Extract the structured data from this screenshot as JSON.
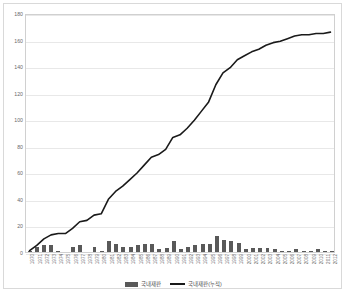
{
  "chart_data": {
    "type": "bar",
    "title": "",
    "xlabel": "",
    "ylabel": "",
    "ylim": [
      0,
      180
    ],
    "ytick_step": 20,
    "yticks": [
      "0",
      "20",
      "40",
      "60",
      "80",
      "100",
      "120",
      "140",
      "160",
      "180"
    ],
    "grid": true,
    "legend_position": "bottom",
    "colors": {
      "bar": "#595959",
      "line": "#1a1a1a",
      "gridline": "#e8e8e8",
      "border": "#d0d0d0",
      "frame": "#d9d9d9",
      "tick_text": "#6a6a6a"
    },
    "categories": [
      "1970",
      "1971",
      "1972",
      "1973",
      "1974",
      "1975",
      "1976",
      "1977",
      "1978",
      "1979",
      "1980",
      "1981",
      "1982",
      "1983",
      "1984",
      "1985",
      "1986",
      "1987",
      "1988",
      "1989",
      "1990",
      "1991",
      "1992",
      "1993",
      "1994",
      "1995",
      "1996",
      "1997",
      "1998",
      "1999",
      "2000",
      "2001",
      "2002",
      "2003",
      "2004",
      "2005",
      "2006",
      "2007",
      "2008",
      "2009",
      "2010",
      "2011",
      "2012"
    ],
    "series": [
      {
        "name": "국내재판",
        "type": "bar",
        "values": [
          1,
          4,
          5,
          5,
          1,
          0,
          4,
          5,
          0,
          4,
          1,
          8,
          6,
          4,
          4,
          5,
          6,
          6,
          2,
          3,
          8,
          2,
          4,
          5,
          6,
          6,
          12,
          9,
          8,
          7,
          2,
          3,
          3,
          3,
          2,
          1,
          1,
          2,
          1,
          1,
          2,
          1,
          1
        ]
      },
      {
        "name": "국내재판(누적)",
        "type": "line",
        "values": [
          1,
          5,
          10,
          13,
          14,
          14,
          18,
          23,
          24,
          28,
          29,
          40,
          46,
          50,
          55,
          60,
          66,
          72,
          74,
          78,
          87,
          89,
          94,
          100,
          107,
          114,
          127,
          136,
          140,
          146,
          149,
          152,
          154,
          157,
          159,
          160,
          162,
          164,
          165,
          165,
          166,
          166,
          167
        ]
      }
    ]
  },
  "legend": {
    "items": [
      {
        "label": "국내재판",
        "marker": "bar-swatch"
      },
      {
        "label": "국내재판(누적)",
        "marker": "line-swatch"
      }
    ]
  }
}
